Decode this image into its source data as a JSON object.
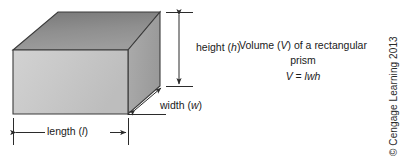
{
  "figure": {
    "canvas": {
      "width": 409,
      "height": 160,
      "background": "#ffffff"
    },
    "shape": {
      "name": "rectangular prism",
      "faces": {
        "front_fill": "#c9c9c9",
        "top_fill": "#8e8e8e",
        "side_fill": "#a6a6a6",
        "edge_stroke": "#3b3b3b"
      }
    }
  },
  "dimensions": {
    "height": {
      "label_text": "height (",
      "symbol": "h",
      "label_close": ")"
    },
    "width": {
      "label_text": "width (",
      "symbol": "w",
      "label_close": ")"
    },
    "length": {
      "label_text": "length (",
      "symbol": "l",
      "label_close": ")"
    }
  },
  "caption": {
    "line1_pre": "Volume (",
    "line1_var": "V",
    "line1_post": ") of a rectangular prism",
    "formula_lhs": "V",
    "formula_eq": " = ",
    "formula_rhs": "lwh"
  },
  "credit": {
    "text": "© Cengage Learning 2013"
  },
  "colors": {
    "ink": "#1a1a1a",
    "line": "#3b3b3b",
    "background": "#ffffff"
  }
}
